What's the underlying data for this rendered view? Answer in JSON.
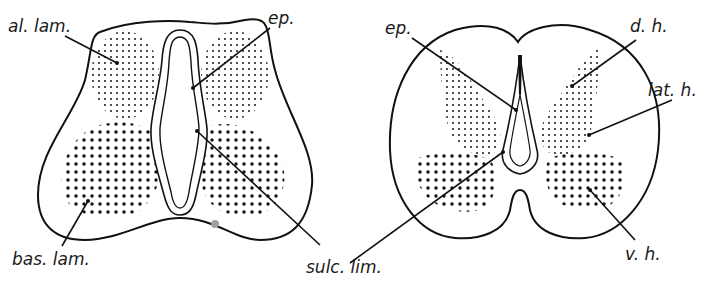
{
  "figure": {
    "left_section": {
      "labels": [
        {
          "id": "al-lam",
          "text": "al. lam."
        },
        {
          "id": "ep",
          "text": "ep."
        },
        {
          "id": "bas-lam",
          "text": "bas. lam."
        },
        {
          "id": "sulc-lim",
          "text": "sulc. lim."
        }
      ]
    },
    "right_section": {
      "labels": [
        {
          "id": "ep",
          "text": "ep."
        },
        {
          "id": "d-h",
          "text": "d. h."
        },
        {
          "id": "lat-h",
          "text": "lat. h."
        },
        {
          "id": "v-h",
          "text": "v. h."
        }
      ]
    },
    "colors": {
      "ink": "#111111",
      "background": "#ffffff",
      "spot": "#a0a0a0"
    }
  }
}
